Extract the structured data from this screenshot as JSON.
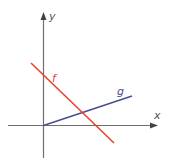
{
  "diagram": {
    "type": "coordinate-plane-two-lines",
    "axes": {
      "x_label": "x",
      "y_label": "y",
      "color": "#6e6e6e"
    },
    "lines": [
      {
        "name": "f",
        "label": "f",
        "color": "#e8432d",
        "slope_sign": "negative",
        "description": "decreasing line crossing positive y-axis and positive x-axis"
      },
      {
        "name": "g",
        "label": "g",
        "color": "#4a4f8e",
        "slope_sign": "positive",
        "description": "increasing line starting at origin"
      }
    ]
  }
}
